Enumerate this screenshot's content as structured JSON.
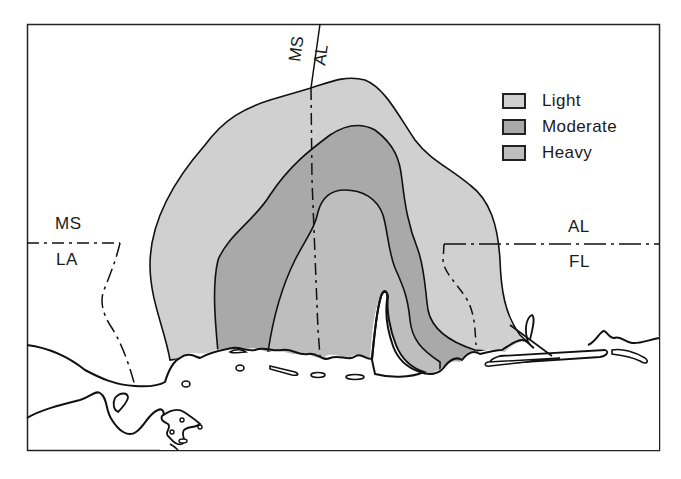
{
  "map": {
    "title": "",
    "legend": {
      "items": [
        {
          "label": "Light",
          "color": "#d0d0d0"
        },
        {
          "label": "Moderate",
          "color": "#a9a9a9"
        },
        {
          "label": "Heavy",
          "color": "#bebebe"
        }
      ]
    },
    "state_labels": {
      "ms_top": "MS",
      "al_top": "AL",
      "ms_left": "MS",
      "la_left": "LA",
      "al_right": "AL",
      "fl_right": "FL"
    },
    "colors": {
      "outline": "#111111",
      "background": "#ffffff",
      "light": "#d0d0d0",
      "moderate": "#a9a9a9",
      "heavy": "#bebebe"
    }
  }
}
